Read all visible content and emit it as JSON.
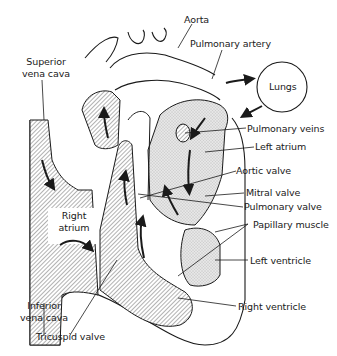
{
  "diagram": {
    "labels": {
      "aorta": "Aorta",
      "pulmonary_artery": "Pulmonary artery",
      "superior_vena_cava_1": "Superior",
      "superior_vena_cava_2": "vena cava",
      "lungs": "Lungs",
      "pulmonary_veins": "Pulmonary veins",
      "left_atrium": "Left atrium",
      "aortic_valve": "Aortic valve",
      "mitral_valve": "Mitral valve",
      "pulmonary_valve": "Pulmonary valve",
      "papillary_muscle": "Papillary muscle",
      "right_atrium_1": "Right",
      "right_atrium_2": "atrium",
      "left_ventricle": "Left ventricle",
      "right_ventricle": "Right ventricle",
      "inferior_vena_cava_1": "Inferior",
      "inferior_vena_cava_2": "vena cava",
      "tricuspid_valve": "Tricuspid valve"
    },
    "colors": {
      "line": "#1a1a1a",
      "oxygen_poor_hatch": "#555555",
      "oxygen_rich_stipple": "#d8d8d8",
      "background": "#ffffff"
    }
  }
}
